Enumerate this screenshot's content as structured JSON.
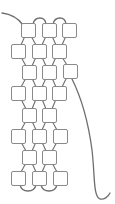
{
  "diagram": {
    "type": "bead-weaving-pattern",
    "bead_color": "#ffffff",
    "bead_stroke": "#8a8a8a",
    "thread_color": "#6e6e6e",
    "bead_size": 14,
    "beads": [
      {
        "row": 1,
        "x": 21,
        "y": 23
      },
      {
        "row": 1,
        "x": 42,
        "y": 23
      },
      {
        "row": 1,
        "x": 62,
        "y": 23
      },
      {
        "row": 2,
        "x": 11,
        "y": 44
      },
      {
        "row": 2,
        "x": 32,
        "y": 44
      },
      {
        "row": 2,
        "x": 52,
        "y": 44
      },
      {
        "row": 3,
        "x": 22,
        "y": 65
      },
      {
        "row": 3,
        "x": 42,
        "y": 65
      },
      {
        "row": 3,
        "x": 63,
        "y": 64
      },
      {
        "row": 4,
        "x": 11,
        "y": 86
      },
      {
        "row": 4,
        "x": 32,
        "y": 86
      },
      {
        "row": 4,
        "x": 52,
        "y": 86
      },
      {
        "row": 5,
        "x": 22,
        "y": 108
      },
      {
        "row": 5,
        "x": 42,
        "y": 108
      },
      {
        "row": 6,
        "x": 11,
        "y": 129
      },
      {
        "row": 6,
        "x": 32,
        "y": 129
      },
      {
        "row": 6,
        "x": 53,
        "y": 129
      },
      {
        "row": 7,
        "x": 22,
        "y": 150
      },
      {
        "row": 7,
        "x": 42,
        "y": 150
      },
      {
        "row": 8,
        "x": 11,
        "y": 171
      },
      {
        "row": 8,
        "x": 32,
        "y": 171
      },
      {
        "row": 8,
        "x": 53,
        "y": 171
      }
    ]
  }
}
